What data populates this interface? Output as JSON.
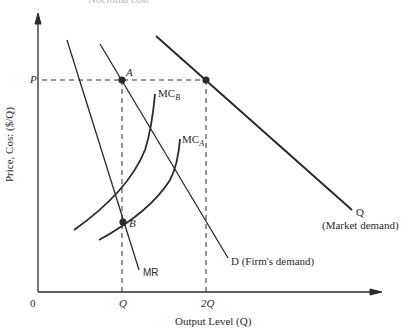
{
  "figure": {
    "top_cut_text": "Nocional cost",
    "y_axis_label": "Price, Cos: ($/Q)",
    "x_axis_label": "Output Level (Q)",
    "origin_label": "0",
    "tick_p": "P",
    "tick_q": "Q",
    "tick_2q": "2Q",
    "point_a": "A",
    "point_b": "B",
    "curve_mcb": "MC",
    "curve_mcb_sub": "B",
    "curve_mca": "MC",
    "curve_mca_sub": "A",
    "curve_mr": "MR",
    "curve_d": "D (Firm's demand)",
    "curve_q": "Q",
    "curve_q_sub": "(Market demand)"
  },
  "colors": {
    "line": "#2a2a2a",
    "background": "#ffffff"
  }
}
